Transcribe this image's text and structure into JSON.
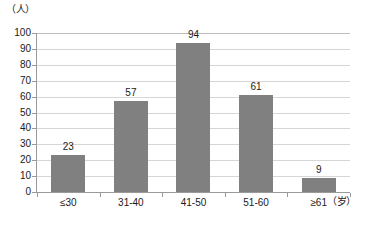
{
  "chart_data": {
    "type": "bar",
    "title": "",
    "subtitle": "",
    "xlabel": "（岁）",
    "ylabel": "（人）",
    "categories": [
      "≤30",
      "31-40",
      "41-50",
      "51-60",
      "≥61"
    ],
    "values": [
      23,
      57,
      94,
      61,
      9
    ],
    "series": [
      {
        "name": "",
        "values": [
          23,
          57,
          94,
          61,
          9
        ]
      }
    ],
    "ylim": [
      0,
      100
    ],
    "y_ticks": [
      0,
      10,
      20,
      30,
      40,
      50,
      60,
      70,
      80,
      90,
      100
    ],
    "y_tick_labels": [
      "0",
      "10",
      "20",
      "30",
      "40",
      "50",
      "60",
      "70",
      "80",
      "90",
      "100"
    ],
    "data_labels": [
      "23",
      "57",
      "94",
      "61",
      "9"
    ],
    "grid": true,
    "grid_axis": "y",
    "legend": false,
    "legend_position": "none",
    "bar_color": "#808080",
    "gridline_color": "#d6d6d6",
    "axis_color": "#9a9a9a",
    "background_color": "#ffffff",
    "text_color": "#1a1a1a"
  }
}
